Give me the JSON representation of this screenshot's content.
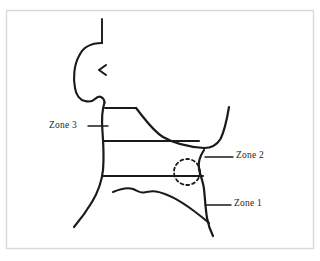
{
  "figure": {
    "background_color": "#ffffff",
    "frame": {
      "name": "image-border",
      "color": "#d7d7d7",
      "x": 6,
      "y": 10,
      "width": 307,
      "height": 238
    },
    "ink_color": "#1a1a1a",
    "label_color": "#231f20"
  },
  "labels": {
    "zone_3": "Zone 3",
    "zone_2": "Zone 2",
    "zone_1": "Zone 1"
  },
  "annotations": [
    {
      "id": "zone-3",
      "text": "Zone 3",
      "leader_from_x": 88,
      "leader_to_x": 108,
      "leader_y": 126,
      "side": "left"
    },
    {
      "id": "zone-2",
      "text": "Zone 2",
      "leader_from_x": 205,
      "leader_to_x": 233,
      "leader_y": 157,
      "side": "right"
    },
    {
      "id": "zone-1",
      "text": "Zone 1",
      "leader_from_x": 205,
      "leader_to_x": 231,
      "leader_y": 205,
      "side": "right"
    }
  ],
  "drawing": {
    "head_profile": "side view of a human head facing right with hair tuft, ear marker and chin",
    "hair_tuft": "M 102 19 L 102 43",
    "head_outline": "M 102 43 C 92 43 83 47 79 56 C 74 65 73 78 75 88 C 76 95 80 100 85 101 C 89 102 93 101 95 99 C 97 97 99 96 101 97 C 103 98 104 100 104 102",
    "ear_mark": "M 106 65 L 99 70 L 106 75",
    "neck_left": "M 104 102 C 102 110 102 120 103 132 C 104 145 104 158 103 170 C 102 180 98 192 92 202 C 86 212 80 220 74 227",
    "zone_top_line": "M 105 108 L 136 108",
    "shoulder_slope": "M 136 108 C 145 119 152 130 163 137 C 175 144 190 147 205 148",
    "zone_mid_line": "M 104 141 L 199 141",
    "zone_bottom_line": "M 103 176 L 203 176",
    "right_shoulder_arm": "M 205 148 C 211 148 216 146 220 140 C 224 132 227 120 229 108",
    "trapezius_right": "M 204 151 C 200 157 198 163 199 169 C 200 175 203 181 204 189 C 205 198 205 209 207 218 C 208 226 210 231 213 236",
    "clavicle": "M 113 192 C 120 189 128 187 134 189 C 137 190 139 192 142 192 C 146 192 150 190 156 191 C 168 193 182 202 194 211 C 200 215 205 219 209 223",
    "dashed_circle": {
      "cx": 187,
      "cy": 172,
      "r": 13,
      "dash": "3 3"
    }
  }
}
